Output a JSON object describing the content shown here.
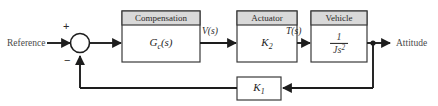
{
  "diagram": {
    "type": "control-system-block-diagram",
    "colors": {
      "line": "#1d1d1d",
      "block_border": "#3a3a3a",
      "block_fill": "#ffffff",
      "header_fill": "#d9d9d9",
      "text": "#2a2a2a",
      "io_text": "#4a4a4a"
    },
    "input": {
      "label": "Reference"
    },
    "output": {
      "label": "Attitude"
    },
    "summing_junction": {
      "name": "summing-junction",
      "positive_sign": "+",
      "negative_sign": "−"
    },
    "blocks": [
      {
        "id": "compensation",
        "header": "Compensation",
        "body_base": "G",
        "body_sub": "c",
        "body_tail": "(s)",
        "has_header": true
      },
      {
        "id": "actuator",
        "header": "Actuator",
        "body_base": "K",
        "body_sub": "2",
        "body_tail": "",
        "has_header": true
      },
      {
        "id": "vehicle",
        "header": "Vehicle",
        "body_numerator": "1",
        "body_denominator_base": "Js",
        "body_denominator_sup": "2",
        "has_header": true
      },
      {
        "id": "feedback-gain",
        "header": "",
        "body_base": "K",
        "body_sub": "1",
        "body_tail": "",
        "has_header": false
      }
    ],
    "signals": [
      {
        "id": "v-of-s",
        "label": "V(s)"
      },
      {
        "id": "t-of-s",
        "label": "T(s)"
      }
    ]
  }
}
